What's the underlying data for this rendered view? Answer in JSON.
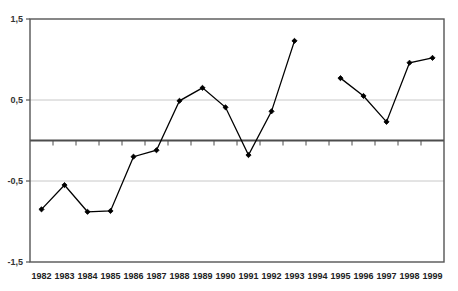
{
  "chart_data": {
    "type": "line",
    "title": "",
    "subtitle": "",
    "xlabel": "",
    "ylabel": "",
    "x": [
      1982,
      1983,
      1984,
      1985,
      1986,
      1987,
      1988,
      1989,
      1990,
      1991,
      1992,
      1993,
      1995,
      1996,
      1997,
      1998,
      1999
    ],
    "categories": [
      "1982",
      "1983",
      "1984",
      "1985",
      "1986",
      "1987",
      "1988",
      "1989",
      "1990",
      "1991",
      "1992",
      "1993",
      "1994",
      "1995",
      "1996",
      "1997",
      "1998",
      "1999"
    ],
    "values": [
      -0.85,
      -0.55,
      -0.88,
      -0.87,
      -0.2,
      -0.12,
      0.49,
      0.65,
      0.41,
      -0.18,
      0.36,
      1.23,
      null,
      0.77,
      0.55,
      0.23,
      0.96,
      1.02
    ],
    "series": [
      {
        "name": "series-1",
        "points": [
          {
            "x": 1982,
            "y": -0.85
          },
          {
            "x": 1983,
            "y": -0.55
          },
          {
            "x": 1984,
            "y": -0.88
          },
          {
            "x": 1985,
            "y": -0.87
          },
          {
            "x": 1986,
            "y": -0.2
          },
          {
            "x": 1987,
            "y": -0.12
          },
          {
            "x": 1988,
            "y": 0.49
          },
          {
            "x": 1989,
            "y": 0.65
          },
          {
            "x": 1990,
            "y": 0.41
          },
          {
            "x": 1991,
            "y": -0.18
          },
          {
            "x": 1992,
            "y": 0.36
          },
          {
            "x": 1993,
            "y": 1.23
          }
        ]
      },
      {
        "name": "series-1-continued",
        "points": [
          {
            "x": 1995,
            "y": 0.77
          },
          {
            "x": 1996,
            "y": 0.55
          },
          {
            "x": 1997,
            "y": 0.23
          },
          {
            "x": 1998,
            "y": 0.96
          },
          {
            "x": 1999,
            "y": 1.02
          }
        ]
      }
    ],
    "gaps": [
      {
        "after": 1993,
        "before": 1995
      }
    ],
    "ylim": [
      -1.5,
      1.5
    ],
    "yticks": [
      -1.5,
      -0.5,
      0.5,
      1.5
    ],
    "ytick_labels": [
      "-1,5",
      "-0,5",
      "0,5",
      "1,5"
    ],
    "xtick_labels": [
      "1982",
      "1983",
      "1984",
      "1985",
      "1986",
      "1987",
      "1988",
      "1989",
      "1990",
      "1991",
      "1992",
      "1993",
      "1994",
      "1995",
      "1996",
      "1997",
      "1998",
      "1999"
    ],
    "grid": true,
    "gridlines_at": [
      -0.5,
      0.5
    ],
    "zero_line": 0,
    "legend": "none",
    "marker": "diamond",
    "line_color": "#000000",
    "grid_color": "#c8c8c8",
    "axis_color": "#555555",
    "zero_line_color": "#4d4d4d"
  },
  "axes": {
    "y_labels": [
      {
        "text": "1,5",
        "value": 1.5
      },
      {
        "text": "0,5",
        "value": 0.5
      },
      {
        "text": "-0,5",
        "value": -0.5
      },
      {
        "text": "-1,5",
        "value": -1.5
      }
    ],
    "x_labels": [
      {
        "text": "1982"
      },
      {
        "text": "1983"
      },
      {
        "text": "1984"
      },
      {
        "text": "1985"
      },
      {
        "text": "1986"
      },
      {
        "text": "1987"
      },
      {
        "text": "1988"
      },
      {
        "text": "1989"
      },
      {
        "text": "1990"
      },
      {
        "text": "1991"
      },
      {
        "text": "1992"
      },
      {
        "text": "1993"
      },
      {
        "text": "1994"
      },
      {
        "text": "1995"
      },
      {
        "text": "1996"
      },
      {
        "text": "1997"
      },
      {
        "text": "1998"
      },
      {
        "text": "1999"
      }
    ]
  }
}
